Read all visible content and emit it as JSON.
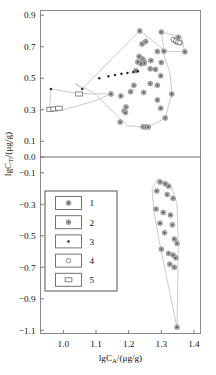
{
  "chart_data": {
    "type": "scatter",
    "title": "",
    "xlabel": "lgC_A/(μg/g)",
    "xlabel_main": "lgC",
    "xlabel_sub": "A",
    "xlabel_unit": "/(μg/g)",
    "ylabel": "lgC_Ti/(μg/g)",
    "ylabel_main": "lgC",
    "ylabel_sub": "Ti",
    "ylabel_unit": "/(μg/g)",
    "xlim": [
      0.93,
      1.42
    ],
    "ylim": [
      -1.12,
      0.93
    ],
    "xticks": [
      1.0,
      1.1,
      1.2,
      1.3,
      1.4
    ],
    "xticklabels": [
      "1.0",
      "1.1",
      "1.2",
      "1.3",
      "1.4"
    ],
    "yticks": [
      0.9,
      0.7,
      0.5,
      0.3,
      0.1,
      0.0,
      -0.1,
      -0.3,
      -0.5,
      -0.7,
      -0.9,
      -1.1
    ],
    "yticklabels": [
      "0.9",
      "0.7",
      "0.5",
      "0.3",
      "0.1",
      "0.0",
      "−0.1",
      "−0.3",
      "−0.5",
      "−0.7",
      "−0.9",
      "−1.1"
    ],
    "grid": false,
    "zero_line": 0.0,
    "legend_position": "lower-left",
    "legend": [
      {
        "label": "1",
        "marker": "circle-dot-gray"
      },
      {
        "label": "2",
        "marker": "circle-dot-gray"
      },
      {
        "label": "3",
        "marker": "dot-filled-black"
      },
      {
        "label": "4",
        "marker": "circle-open"
      },
      {
        "label": "5",
        "marker": "rectangle-open"
      }
    ],
    "series": [
      {
        "name": "1",
        "marker": "circle-dot-gray",
        "points": [
          [
            1.234,
            0.8
          ],
          [
            1.252,
            0.733
          ],
          [
            1.241,
            0.718
          ],
          [
            1.232,
            0.638
          ],
          [
            1.243,
            0.622
          ],
          [
            1.247,
            0.607
          ],
          [
            1.248,
            0.596
          ],
          [
            1.238,
            0.592
          ],
          [
            1.228,
            0.603
          ],
          [
            1.268,
            0.612
          ],
          [
            1.266,
            0.56
          ],
          [
            1.282,
            0.556
          ],
          [
            1.222,
            0.548
          ],
          [
            1.298,
            0.516
          ],
          [
            1.266,
            0.466
          ],
          [
            1.288,
            0.455
          ],
          [
            1.216,
            0.455
          ],
          [
            1.206,
            0.415
          ],
          [
            1.246,
            0.41
          ],
          [
            1.332,
            0.4
          ],
          [
            1.146,
            0.4
          ],
          [
            1.176,
            0.388
          ],
          [
            1.288,
            0.362
          ],
          [
            1.298,
            0.31
          ],
          [
            1.192,
            0.318
          ],
          [
            1.186,
            0.292
          ],
          [
            1.19,
            0.282
          ],
          [
            1.312,
            0.248
          ],
          [
            1.174,
            0.222
          ],
          [
            1.244,
            0.192
          ],
          [
            1.252,
            0.19
          ],
          [
            1.26,
            0.19
          ],
          [
            1.288,
            0.67
          ],
          [
            1.3,
            0.6
          ]
        ]
      },
      {
        "name": "2",
        "marker": "circle-dot-gray",
        "points": [
          [
            1.3,
            0.793
          ],
          [
            1.352,
            0.76
          ],
          [
            1.338,
            0.745
          ],
          [
            1.344,
            0.736
          ],
          [
            1.348,
            0.73
          ],
          [
            1.357,
            0.726
          ],
          [
            1.308,
            0.672
          ],
          [
            1.372,
            0.668
          ],
          [
            1.296,
            -0.158
          ],
          [
            1.312,
            -0.17
          ],
          [
            1.322,
            -0.185
          ],
          [
            1.286,
            -0.215
          ],
          [
            1.318,
            -0.238
          ],
          [
            1.336,
            -0.262
          ],
          [
            1.284,
            -0.33
          ],
          [
            1.306,
            -0.352
          ],
          [
            1.328,
            -0.368
          ],
          [
            1.296,
            -0.42
          ],
          [
            1.334,
            -0.43
          ],
          [
            1.31,
            -0.48
          ],
          [
            1.34,
            -0.52
          ],
          [
            1.348,
            -0.548
          ],
          [
            1.3,
            -0.585
          ],
          [
            1.322,
            -0.612
          ],
          [
            1.336,
            -0.622
          ],
          [
            1.344,
            -0.64
          ],
          [
            1.326,
            -0.68
          ],
          [
            1.34,
            -0.7
          ],
          [
            1.348,
            -1.08
          ]
        ]
      },
      {
        "name": "3",
        "marker": "dot-filled-black",
        "points": [
          [
            0.962,
            0.432
          ],
          [
            1.11,
            0.5
          ],
          [
            1.138,
            0.512
          ],
          [
            1.158,
            0.52
          ],
          [
            1.178,
            0.528
          ],
          [
            1.196,
            0.534
          ],
          [
            1.214,
            0.54
          ],
          [
            1.228,
            0.545
          ],
          [
            1.058,
            0.432
          ]
        ]
      },
      {
        "name": "4",
        "marker": "circle-open",
        "points": [
          [
            1.336,
            0.745
          ],
          [
            1.344,
            0.737
          ],
          [
            1.35,
            0.73
          ],
          [
            1.356,
            0.726
          ]
        ]
      },
      {
        "name": "5",
        "marker": "rectangle-open",
        "points": [
          [
            0.96,
            0.303
          ],
          [
            0.972,
            0.305
          ],
          [
            0.986,
            0.31
          ],
          [
            1.048,
            0.4
          ]
        ]
      }
    ],
    "hulls": [
      {
        "name": "main-central-hull",
        "vertices": [
          [
            1.234,
            0.802
          ],
          [
            1.3,
            0.692
          ],
          [
            1.326,
            0.54
          ],
          [
            1.332,
            0.4
          ],
          [
            1.312,
            0.248
          ],
          [
            1.258,
            0.188
          ],
          [
            1.196,
            0.198
          ],
          [
            1.146,
            0.3
          ],
          [
            1.09,
            0.412
          ],
          [
            1.036,
            0.466
          ],
          [
            1.058,
            0.432
          ]
        ]
      },
      {
        "name": "left-upper-hull",
        "vertices": [
          [
            0.962,
            0.432
          ],
          [
            1.048,
            0.402
          ],
          [
            1.146,
            0.4
          ],
          [
            1.09,
            0.352
          ],
          [
            1.0,
            0.3
          ],
          [
            0.958,
            0.302
          ]
        ]
      },
      {
        "name": "upper-right-hull",
        "vertices": [
          [
            1.3,
            0.793
          ],
          [
            1.362,
            0.762
          ],
          [
            1.372,
            0.668
          ],
          [
            1.308,
            0.672
          ]
        ]
      },
      {
        "name": "lower-right-hull",
        "vertices": [
          [
            1.29,
            -0.14
          ],
          [
            1.33,
            -0.18
          ],
          [
            1.348,
            -0.3
          ],
          [
            1.352,
            -0.56
          ],
          [
            1.348,
            -1.082
          ],
          [
            1.296,
            -0.56
          ],
          [
            1.276,
            -0.33
          ],
          [
            1.272,
            -0.2
          ]
        ]
      }
    ]
  }
}
